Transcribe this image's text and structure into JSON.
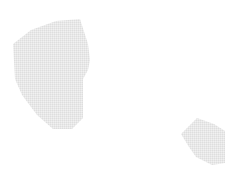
{
  "canvas": {
    "width": 225,
    "height": 188,
    "background_color": "#ffffff",
    "description": "Two pale gray polygonal map regions on a blank white background"
  },
  "style": {
    "region_fill": "#e4e4e4",
    "region_fill_light": "#ececec",
    "texture": "fine dithered halftone speckle",
    "texture_opacity": 0.45,
    "stroke": "none"
  },
  "regions": [
    {
      "id": "region-large",
      "name": "large-region-polygon",
      "fill": "#e4e4e4",
      "bbox": {
        "x": 10,
        "y": 18,
        "width": 81,
        "height": 113
      },
      "points": "80,19 88,44 90,60 88,70 83,79 83,118 72,129 53,129 37,115 22,95 15,79 13,44 31,30 56,21"
    },
    {
      "id": "region-small",
      "name": "small-region-polygon",
      "fill": "#e4e4e4",
      "bbox": {
        "x": 180,
        "y": 117,
        "width": 45,
        "height": 48
      },
      "clipped_edge": "right",
      "points": "197,118 214,124 225,131 225,163 212,165 196,157 189,147 181,134"
    }
  ]
}
